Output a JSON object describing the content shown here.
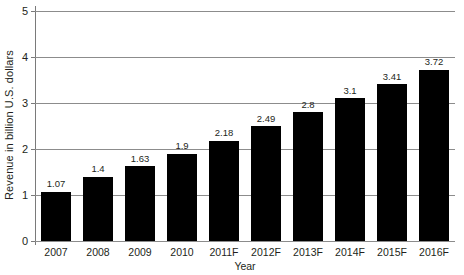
{
  "chart_data": {
    "type": "bar",
    "title": "",
    "xlabel": "Year",
    "ylabel": "Revenue in billion U.S. dollars",
    "categories": [
      "2007",
      "2008",
      "2009",
      "2010",
      "2011F",
      "2012F",
      "2013F",
      "2014F",
      "2015F",
      "2016F"
    ],
    "values": [
      1.07,
      1.4,
      1.63,
      1.9,
      2.18,
      2.49,
      2.8,
      3.1,
      3.41,
      3.72
    ],
    "value_labels": [
      "1.07",
      "1.4",
      "1.63",
      "1.9",
      "2.18",
      "2.49",
      "2.8",
      "3.1",
      "3.41",
      "3.72"
    ],
    "ylim": [
      0,
      5
    ],
    "yticks": [
      0,
      1,
      2,
      3,
      4,
      5
    ],
    "ytick_labels": [
      "0",
      "1",
      "2",
      "3",
      "4",
      "5"
    ],
    "grid": true,
    "legend": "none",
    "bar_color": "#000000",
    "grid_color": "#8c8c8c",
    "axis_color": "#7a7a7a",
    "text_color": "#231f20"
  }
}
